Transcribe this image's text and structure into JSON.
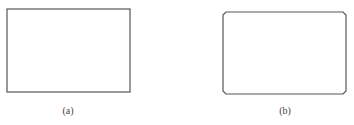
{
  "figures": [
    {
      "label": "(a)",
      "shape": "rectangle",
      "corners": "square"
    },
    {
      "label": "(b)",
      "shape": "rectangle",
      "corners": "chamfered"
    }
  ],
  "colors": {
    "stroke": "#555555",
    "text": "#444444"
  }
}
